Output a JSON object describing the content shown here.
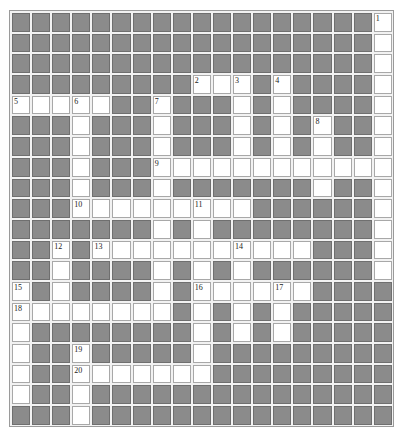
{
  "puzzle": {
    "rows": 20,
    "cols": 19,
    "colors": {
      "block": "#8b8b8b",
      "open": "#ffffff",
      "border": "#a8a8a8"
    },
    "open_cells": {
      "0": [
        18
      ],
      "1": [
        18
      ],
      "2": [
        18
      ],
      "3": [
        9,
        10,
        11,
        13,
        18
      ],
      "4": [
        0,
        1,
        2,
        3,
        4,
        7,
        11,
        13,
        18
      ],
      "5": [
        3,
        7,
        11,
        13,
        15,
        18
      ],
      "6": [
        3,
        7,
        11,
        13,
        15,
        18
      ],
      "7": [
        3,
        7,
        8,
        9,
        10,
        11,
        12,
        13,
        14,
        15,
        16,
        17,
        18
      ],
      "8": [
        3,
        7,
        15,
        18
      ],
      "9": [
        3,
        4,
        5,
        6,
        7,
        8,
        9,
        10,
        11,
        18
      ],
      "10": [
        7,
        9,
        18
      ],
      "11": [
        2,
        4,
        5,
        6,
        7,
        8,
        9,
        10,
        11,
        12,
        13,
        14,
        18
      ],
      "12": [
        2,
        7,
        9,
        11,
        18
      ],
      "13": [
        0,
        2,
        7,
        9,
        10,
        11,
        12,
        13,
        14
      ],
      "14": [
        0,
        1,
        2,
        3,
        4,
        5,
        6,
        7,
        9,
        11,
        13
      ],
      "15": [
        0,
        9,
        11,
        13
      ],
      "16": [
        0,
        3,
        9
      ],
      "17": [
        0,
        3,
        4,
        5,
        6,
        7,
        8,
        9
      ],
      "18": [
        0,
        3
      ],
      "19": [
        3
      ]
    },
    "clue_numbers": [
      {
        "n": "1",
        "r": 0,
        "c": 18
      },
      {
        "n": "2",
        "r": 3,
        "c": 9
      },
      {
        "n": "3",
        "r": 3,
        "c": 11
      },
      {
        "n": "4",
        "r": 3,
        "c": 13
      },
      {
        "n": "5",
        "r": 4,
        "c": 0
      },
      {
        "n": "6",
        "r": 4,
        "c": 3
      },
      {
        "n": "7",
        "r": 4,
        "c": 7
      },
      {
        "n": "8",
        "r": 5,
        "c": 15
      },
      {
        "n": "9",
        "r": 7,
        "c": 7
      },
      {
        "n": "10",
        "r": 9,
        "c": 3
      },
      {
        "n": "11",
        "r": 9,
        "c": 9
      },
      {
        "n": "12",
        "r": 11,
        "c": 2
      },
      {
        "n": "13",
        "r": 11,
        "c": 4
      },
      {
        "n": "14",
        "r": 11,
        "c": 11
      },
      {
        "n": "15",
        "r": 13,
        "c": 0
      },
      {
        "n": "16",
        "r": 13,
        "c": 9
      },
      {
        "n": "17",
        "r": 13,
        "c": 13
      },
      {
        "n": "18",
        "r": 14,
        "c": 0
      },
      {
        "n": "19",
        "r": 16,
        "c": 3
      },
      {
        "n": "20",
        "r": 17,
        "c": 3
      }
    ]
  }
}
